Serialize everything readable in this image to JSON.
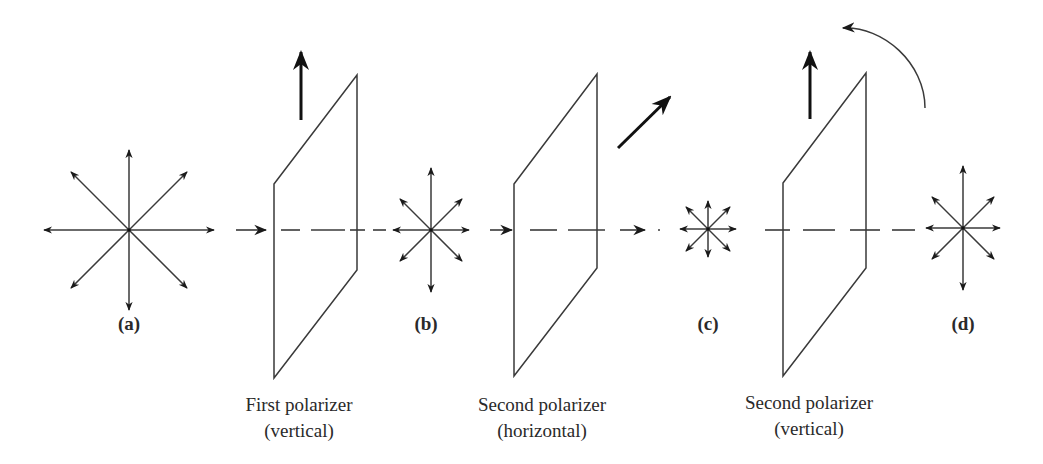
{
  "figure": {
    "colors": {
      "line": "#3a3a3a",
      "arrow": "#1a1a1a",
      "background": "#ffffff"
    },
    "axis_y": 230,
    "stages": [
      {
        "id": "a",
        "label": "(a)",
        "cx": 129,
        "cy": 230,
        "rv": 80,
        "rh": 85,
        "rd": 58,
        "label_x": 129,
        "label_y": 323
      },
      {
        "id": "b",
        "label": "(b)",
        "cx": 431,
        "cy": 230,
        "rv": 62,
        "rh": 38,
        "rd": 31,
        "label_x": 426,
        "label_y": 323
      },
      {
        "id": "c",
        "label": "(c)",
        "cx": 708,
        "cy": 229,
        "rv": 28,
        "rh": 28,
        "rd": 22,
        "label_x": 708,
        "label_y": 323
      },
      {
        "id": "d",
        "label": "(d)",
        "cx": 963,
        "cy": 228,
        "rv": 62,
        "rh": 37,
        "rd": 31,
        "label_x": 963,
        "label_y": 323
      }
    ],
    "polarizers": [
      {
        "id": "first",
        "name": "First polarizer",
        "orientation": "(vertical)",
        "left_x": 274,
        "left_top": 184,
        "left_bottom": 378,
        "right_x": 357,
        "right_top": 75,
        "right_bottom": 270,
        "axis_arrow": {
          "x1": 301,
          "y1": 120,
          "x2": 301,
          "y2": 52
        },
        "caption_x": 299,
        "caption_y": 395
      },
      {
        "id": "second-horizontal",
        "name": "Second polarizer",
        "orientation": "(horizontal)",
        "left_x": 514,
        "left_top": 184,
        "left_bottom": 376,
        "right_x": 597,
        "right_top": 74,
        "right_bottom": 268,
        "axis_arrow": {
          "x1": 618,
          "y1": 148,
          "x2": 670,
          "y2": 97
        },
        "caption_x": 542,
        "caption_y": 395
      },
      {
        "id": "second-vertical",
        "name": "Second polarizer",
        "orientation": "(vertical)",
        "left_x": 783,
        "left_top": 183,
        "left_bottom": 376,
        "right_x": 866,
        "right_top": 73,
        "right_bottom": 268,
        "axis_arrow": {
          "x1": 810,
          "y1": 119,
          "x2": 810,
          "y2": 52
        },
        "caption_x": 809,
        "caption_y": 392
      }
    ],
    "rotation_arrow": {
      "start_x": 925,
      "start_y": 108,
      "end_x": 843,
      "end_y": 28
    },
    "beam_segments": [
      {
        "type": "arrow",
        "x1": 236,
        "x2": 266
      },
      {
        "type": "dash",
        "x1": 281,
        "x2": 300
      },
      {
        "type": "dash",
        "x1": 311,
        "x2": 345
      },
      {
        "type": "dash",
        "x1": 350,
        "x2": 365
      },
      {
        "type": "dash",
        "x1": 373,
        "x2": 386
      },
      {
        "type": "arrow",
        "x1": 490,
        "x2": 512
      },
      {
        "type": "dash",
        "x1": 530,
        "x2": 557
      },
      {
        "type": "dash",
        "x1": 568,
        "x2": 605
      },
      {
        "type": "arrow",
        "x1": 620,
        "x2": 645
      },
      {
        "type": "dot",
        "x1": 658,
        "x2": 660
      },
      {
        "type": "dash",
        "x1": 765,
        "x2": 790
      },
      {
        "type": "dash",
        "x1": 803,
        "x2": 835
      },
      {
        "type": "dash",
        "x1": 850,
        "x2": 880
      },
      {
        "type": "dash",
        "x1": 892,
        "x2": 915
      }
    ]
  }
}
